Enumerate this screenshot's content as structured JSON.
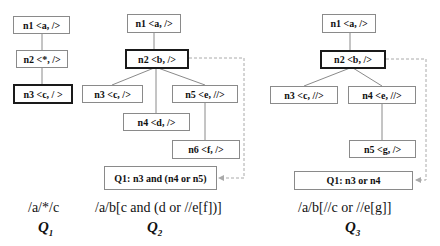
{
  "q1": {
    "nodes": {
      "n1": "n1 <a, />",
      "n2": "n2 <*, />",
      "n3": "n3 <c, / >"
    },
    "xpath": "/a/*/c",
    "label": "Q",
    "label_sub": "1"
  },
  "q2": {
    "nodes": {
      "n1": "n1 <a, />",
      "n2": "n2 <b, />",
      "n3": "n3 <c, />",
      "n4": "n4 <d, />",
      "n5": "n5 <e, //>",
      "n6": "n6 <f, />"
    },
    "result": "Q1: n3 and (n4 or n5)",
    "xpath": "/a/b[c and (d or //e[f])]",
    "label": "Q",
    "label_sub": "2"
  },
  "q3": {
    "nodes": {
      "n1": "n1 <a, />",
      "n2": "n2 <b, />",
      "n3": "n3 <c, //>",
      "n4": "n4 <e, //>",
      "n5": "n5 <g, />"
    },
    "result": "Q1: n3 or n4",
    "xpath": "/a/b[//c or //e[g]]",
    "label": "Q",
    "label_sub": "3"
  }
}
